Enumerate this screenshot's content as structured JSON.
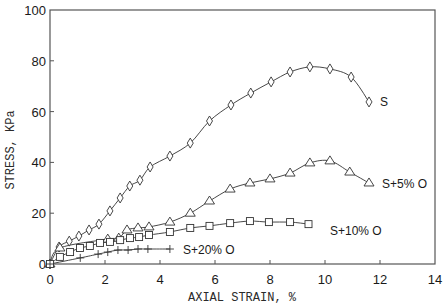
{
  "chart_data": {
    "type": "line",
    "title": "",
    "xlabel": "AXIAL STRAIN, %",
    "ylabel": "STRESS, KPa",
    "xlim": [
      0,
      14
    ],
    "ylim": [
      0,
      100
    ],
    "xticks": [
      "0",
      "2",
      "4",
      "6",
      "8",
      "10",
      "12",
      "14"
    ],
    "yticks": [
      "0",
      "20",
      "40",
      "60",
      "80",
      "100"
    ],
    "grid": false,
    "series": [
      {
        "name": "S",
        "marker": "diamond",
        "label": "S",
        "x": [
          0,
          0.33,
          0.7,
          1.05,
          1.42,
          1.78,
          2.18,
          2.55,
          2.9,
          3.27,
          3.64,
          4.36,
          5.1,
          5.8,
          6.58,
          7.3,
          8.04,
          8.73,
          9.45,
          10.18,
          10.95,
          11.6
        ],
        "y": [
          0,
          6.7,
          9,
          11,
          13.4,
          15.7,
          20.9,
          26,
          30.7,
          33,
          38.2,
          42.5,
          47.6,
          56.3,
          62.6,
          67.3,
          71.7,
          75.6,
          77.6,
          76.8,
          73.6,
          63.8
        ]
      },
      {
        "name": "S+5% O",
        "marker": "triangle",
        "label": "S+5% O",
        "x": [
          0,
          0.36,
          2.1,
          2.5,
          2.8,
          3.2,
          3.6,
          4.36,
          5.1,
          5.8,
          6.55,
          7.27,
          8.0,
          8.73,
          9.45,
          10.18,
          10.9,
          11.6
        ],
        "y": [
          0,
          6.3,
          9.8,
          10.2,
          13.4,
          14.2,
          14.6,
          16.5,
          20,
          24.8,
          29.5,
          31.9,
          33.5,
          35.8,
          39.8,
          40.6,
          36.2,
          31.9
        ]
      },
      {
        "name": "S+10% O",
        "marker": "square",
        "label": "S+10% O",
        "x": [
          0,
          0.36,
          0.73,
          1.09,
          1.45,
          1.82,
          2.18,
          2.55,
          2.91,
          3.24,
          3.6,
          4.36,
          5.1,
          5.8,
          6.55,
          7.27,
          7.96,
          8.73,
          9.4
        ],
        "y": [
          0,
          2.8,
          4.7,
          6.3,
          7.1,
          8.3,
          8.7,
          9.4,
          10.2,
          10.6,
          11.4,
          12.6,
          14.2,
          15,
          16.1,
          16.9,
          16.5,
          16.5,
          15.7
        ]
      },
      {
        "name": "S+20% O",
        "marker": "plus",
        "label": "S+20% O",
        "x": [
          0,
          1.1,
          1.75,
          2.1,
          2.47,
          2.84,
          3.2,
          3.56,
          4.36
        ],
        "y": [
          0,
          2.4,
          3.9,
          4.7,
          5.5,
          5.5,
          5.9,
          5.9,
          5.9
        ]
      }
    ],
    "legend": "inline labels at right end of each curve"
  }
}
